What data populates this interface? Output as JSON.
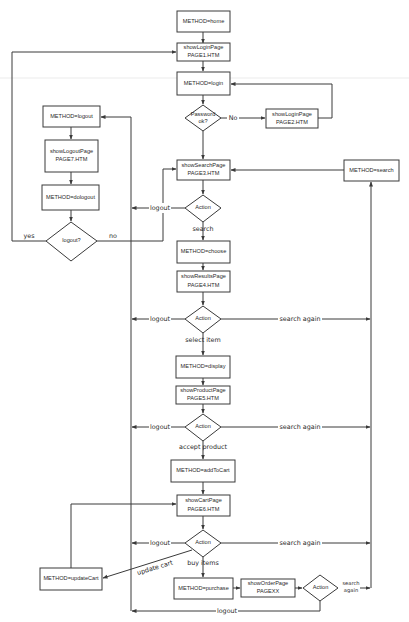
{
  "diagram": {
    "colors": {
      "stroke": "#3a3a3a",
      "text": "#2a2a2a",
      "background": "#ffffff"
    },
    "nodes": {
      "method_home": {
        "type": "process",
        "lines": [
          "METHOD=home"
        ]
      },
      "show_login_1": {
        "type": "page",
        "lines": [
          "showLoginPage",
          "PAGE1.HTM"
        ]
      },
      "method_login": {
        "type": "process",
        "lines": [
          "METHOD=login"
        ]
      },
      "password_ok": {
        "type": "decision",
        "lines": [
          "Password",
          "ok?"
        ]
      },
      "show_login_2": {
        "type": "page",
        "lines": [
          "showLoginPage",
          "PAGE2.HTM"
        ]
      },
      "method_logout": {
        "type": "process",
        "lines": [
          "METHOD=logout"
        ]
      },
      "show_logout_7": {
        "type": "page",
        "lines": [
          "showLogoutPage",
          "PAGE7.HTM"
        ]
      },
      "method_dologout": {
        "type": "process",
        "lines": [
          "METHOD=dologout"
        ]
      },
      "logout_q": {
        "type": "decision",
        "lines": [
          "logout?"
        ]
      },
      "show_search_3": {
        "type": "page",
        "lines": [
          "showSearchPage",
          "PAGE3.HTM"
        ]
      },
      "method_search": {
        "type": "process",
        "lines": [
          "METHOD=search"
        ]
      },
      "action_1": {
        "type": "decision",
        "lines": [
          "Action"
        ]
      },
      "method_choose": {
        "type": "process",
        "lines": [
          "METHOD=choose"
        ]
      },
      "show_results_4": {
        "type": "page",
        "lines": [
          "showResultsPage",
          "PAGE4.HTM"
        ]
      },
      "action_2": {
        "type": "decision",
        "lines": [
          "Action"
        ]
      },
      "method_display": {
        "type": "process",
        "lines": [
          "METHOD=display"
        ]
      },
      "show_product_5": {
        "type": "page",
        "lines": [
          "showProductPage",
          "PAGE5.HTM"
        ]
      },
      "action_3": {
        "type": "decision",
        "lines": [
          "Action"
        ]
      },
      "method_addtocart": {
        "type": "process",
        "lines": [
          "METHOD=addToCart"
        ]
      },
      "show_cart_6": {
        "type": "page",
        "lines": [
          "showCartPage",
          "PAGE6.HTM"
        ]
      },
      "action_4": {
        "type": "decision",
        "lines": [
          "Action"
        ]
      },
      "method_updatecart": {
        "type": "process",
        "lines": [
          "METHOD=updateCart"
        ]
      },
      "method_purchase": {
        "type": "process",
        "lines": [
          "METHOD=purchase"
        ]
      },
      "show_order": {
        "type": "page",
        "lines": [
          "showOrderPage",
          "PAGEXX"
        ]
      },
      "action_5": {
        "type": "decision",
        "lines": [
          "Action"
        ]
      }
    },
    "edge_labels": {
      "no_password": "No",
      "yes_logout": "yes",
      "no_logout": "no",
      "logout_1": "logout",
      "search_1": "search",
      "logout_2": "logout",
      "search_again_2": "search again",
      "select_item": "select item",
      "logout_3": "logout",
      "search_again_3": "search again",
      "accept_product": "accept product",
      "logout_4": "logout",
      "search_again_4": "search again",
      "update_cart": "update cart",
      "buy_items": "buy items",
      "search_again_5_line1": "search",
      "search_again_5_line2": "again",
      "logout_5": "logout"
    }
  }
}
